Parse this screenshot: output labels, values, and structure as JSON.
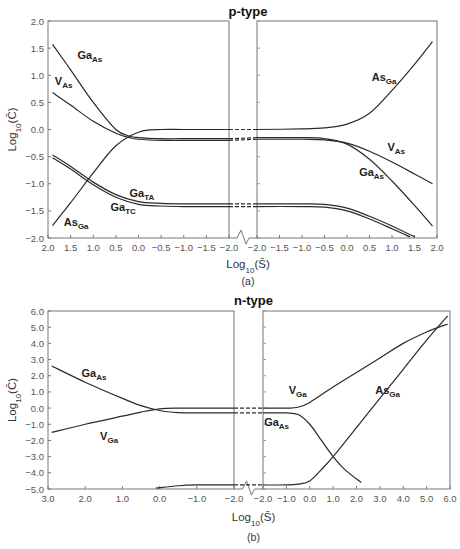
{
  "chart_data": [
    {
      "type": "line",
      "panel_label": "(a)",
      "title": "p-type",
      "xlabel": "Log10(S̄)",
      "ylabel": "Log10(C̄)",
      "ylim": [
        -2.0,
        2.0
      ],
      "yticks": [
        "2.0",
        "1.5",
        "1.0",
        "0.5",
        "0.0",
        "-0.5",
        "-1.0",
        "-1.5",
        "-2.0"
      ],
      "left_axis": {
        "xlim": [
          2.0,
          -2.0
        ],
        "xticks": [
          "2.0",
          "1.5",
          "1.0",
          "0.5",
          "0.0",
          "-0.5",
          "-1.0",
          "-1.5",
          "-2.0"
        ]
      },
      "right_axis": {
        "xlim": [
          -2.0,
          2.0
        ],
        "xticks": [
          "-2.0",
          "-1.5",
          "-1.0",
          "-0.5",
          "0.0",
          "0.5",
          "1.0",
          "1.5",
          "2.0"
        ]
      },
      "grid": false,
      "axis_break": true,
      "series": [
        {
          "name": "GaAs",
          "label": "Ga",
          "sub": "As",
          "side": "left",
          "x": [
            1.9,
            1.5,
            1.0,
            0.5,
            0.2,
            0.0,
            -0.5,
            -1.0,
            -2.0
          ],
          "y": [
            1.57,
            1.1,
            0.5,
            -0.0,
            -0.12,
            -0.15,
            -0.17,
            -0.17,
            -0.17
          ]
        },
        {
          "name": "VAs",
          "label": "V",
          "sub": "As",
          "side": "left",
          "x": [
            1.9,
            1.5,
            1.0,
            0.5,
            0.2,
            0.0,
            -0.5,
            -1.0,
            -2.0
          ],
          "y": [
            0.68,
            0.45,
            0.15,
            -0.07,
            -0.15,
            -0.18,
            -0.2,
            -0.2,
            -0.2
          ]
        },
        {
          "name": "AsGa",
          "label": "As",
          "sub": "Ga",
          "side": "left",
          "x": [
            1.9,
            1.5,
            1.0,
            0.5,
            0.0,
            -0.5,
            -1.0,
            -2.0
          ],
          "y": [
            -1.77,
            -1.35,
            -0.8,
            -0.3,
            -0.05,
            0.0,
            0.0,
            0.0
          ]
        },
        {
          "name": "GaTA",
          "label": "Ga",
          "sub": "TA",
          "side": "left",
          "x": [
            1.9,
            1.5,
            1.0,
            0.5,
            0.0,
            -0.5,
            -1.0,
            -2.0
          ],
          "y": [
            -0.47,
            -0.68,
            -0.97,
            -1.2,
            -1.33,
            -1.36,
            -1.37,
            -1.37
          ]
        },
        {
          "name": "GaTC",
          "label": "Ga",
          "sub": "TC",
          "side": "left",
          "x": [
            1.9,
            1.5,
            1.0,
            0.5,
            0.0,
            -0.5,
            -1.0,
            -2.0
          ],
          "y": [
            -0.52,
            -0.73,
            -1.02,
            -1.25,
            -1.38,
            -1.41,
            -1.42,
            -1.42
          ]
        },
        {
          "name": "AsGa",
          "label": "As",
          "sub": "Ga",
          "side": "right",
          "x": [
            -2.0,
            -1.0,
            -0.5,
            0.0,
            0.5,
            1.0,
            1.5,
            1.9
          ],
          "y": [
            0.0,
            0.01,
            0.03,
            0.1,
            0.3,
            0.72,
            1.2,
            1.62
          ]
        },
        {
          "name": "VAs",
          "label": "V",
          "sub": "As",
          "side": "right",
          "x": [
            -2.0,
            -1.0,
            -0.5,
            0.0,
            0.5,
            1.0,
            1.5,
            1.9
          ],
          "y": [
            -0.18,
            -0.18,
            -0.19,
            -0.25,
            -0.4,
            -0.6,
            -0.82,
            -1.0
          ]
        },
        {
          "name": "GaAs",
          "label": "Ga",
          "sub": "As",
          "side": "right",
          "x": [
            -2.0,
            -1.0,
            -0.5,
            0.0,
            0.5,
            1.0,
            1.5,
            1.9
          ],
          "y": [
            -0.15,
            -0.15,
            -0.17,
            -0.27,
            -0.55,
            -0.95,
            -1.4,
            -1.78
          ]
        },
        {
          "name": "GaTA",
          "label": "Ga",
          "sub": "TA",
          "side": "right",
          "x": [
            -2.0,
            -1.0,
            -0.5,
            0.0,
            0.5,
            1.0,
            1.5
          ],
          "y": [
            -1.37,
            -1.37,
            -1.38,
            -1.45,
            -1.6,
            -1.78,
            -1.98
          ]
        },
        {
          "name": "GaTC",
          "label": "Ga",
          "sub": "TC",
          "side": "right",
          "x": [
            -2.0,
            -1.0,
            -0.5,
            0.0,
            0.5,
            1.0,
            1.4
          ],
          "y": [
            -1.42,
            -1.42,
            -1.43,
            -1.5,
            -1.65,
            -1.83,
            -1.98
          ]
        }
      ],
      "annotations": [
        {
          "text": "Ga",
          "sub": "As",
          "x": 1.35,
          "y": 1.3,
          "side": "left"
        },
        {
          "text": "V",
          "sub": "As",
          "x": 1.85,
          "y": 0.82,
          "side": "left"
        },
        {
          "text": "As",
          "sub": "Ga",
          "x": 1.65,
          "y": -1.78,
          "side": "left"
        },
        {
          "text": "Ga",
          "sub": "TA",
          "x": 0.2,
          "y": -1.25,
          "side": "left"
        },
        {
          "text": "Ga",
          "sub": "TC",
          "x": 0.62,
          "y": -1.5,
          "side": "left"
        },
        {
          "text": "As",
          "sub": "Ga",
          "x": 0.55,
          "y": 0.9,
          "side": "right"
        },
        {
          "text": "V",
          "sub": "As",
          "x": 0.9,
          "y": -0.4,
          "side": "right"
        },
        {
          "text": "Ga",
          "sub": "As",
          "x": 0.27,
          "y": -0.85,
          "side": "right"
        }
      ]
    },
    {
      "type": "line",
      "panel_label": "(b)",
      "title": "n-type",
      "xlabel": "Log10(S̄)",
      "ylabel": "Log10(C̄)",
      "ylim": [
        -5.0,
        6.0
      ],
      "yticks": [
        "6.0",
        "5.0",
        "4.0",
        "3.0",
        "2.0",
        "1.0",
        "0.0",
        "-1.0",
        "-2.0",
        "-3.0",
        "-4.0",
        "-5.0"
      ],
      "left_axis": {
        "xlim": [
          3.0,
          -2.0
        ],
        "xticks": [
          "3.0",
          "2.0",
          "1.0",
          "0.0",
          "-1.0",
          "-2.0"
        ]
      },
      "right_axis": {
        "xlim": [
          -2.0,
          6.0
        ],
        "xticks": [
          "-2.0",
          "-1.0",
          "0.0",
          "1.0",
          "2.0",
          "3.0",
          "4.0",
          "5.0",
          "6.0"
        ]
      },
      "grid": false,
      "axis_break": true,
      "series": [
        {
          "name": "GaAs",
          "label": "Ga",
          "sub": "As",
          "side": "left",
          "x": [
            2.9,
            2.0,
            1.0,
            0.5,
            0.0,
            -0.5,
            -1.0,
            -2.0
          ],
          "y": [
            2.6,
            1.6,
            0.6,
            0.15,
            -0.15,
            -0.28,
            -0.3,
            -0.3
          ]
        },
        {
          "name": "VGa",
          "label": "V",
          "sub": "Ga",
          "side": "left",
          "x": [
            2.9,
            2.0,
            1.0,
            0.5,
            0.0,
            -0.5,
            -1.0,
            -2.0
          ],
          "y": [
            -1.5,
            -1.0,
            -0.5,
            -0.25,
            -0.05,
            0.0,
            0.0,
            0.0
          ]
        },
        {
          "name": "AsGa",
          "label": "As",
          "sub": "Ga",
          "side": "left",
          "x": [
            0.1,
            -0.5,
            -1.0,
            -2.0
          ],
          "y": [
            -4.95,
            -4.8,
            -4.75,
            -4.75
          ]
        },
        {
          "name": "VGa",
          "label": "V",
          "sub": "Ga",
          "side": "right",
          "x": [
            -2.0,
            -1.0,
            -0.5,
            0.0,
            1.0,
            2.0,
            3.0,
            4.0,
            5.0,
            5.9
          ],
          "y": [
            0.0,
            0.0,
            0.05,
            0.35,
            1.3,
            2.2,
            3.1,
            4.0,
            4.7,
            5.2
          ]
        },
        {
          "name": "GaAs",
          "label": "Ga",
          "sub": "As",
          "side": "right",
          "x": [
            -2.0,
            -1.0,
            -0.5,
            0.0,
            0.5,
            1.0,
            1.5,
            2.2
          ],
          "y": [
            -0.3,
            -0.3,
            -0.4,
            -1.0,
            -2.0,
            -3.0,
            -3.8,
            -4.6
          ]
        },
        {
          "name": "AsGa",
          "label": "As",
          "sub": "Ga",
          "side": "right",
          "x": [
            -2.0,
            -1.0,
            -0.5,
            0.0,
            0.5,
            1.0,
            2.0,
            3.0,
            4.0,
            5.0,
            5.9
          ],
          "y": [
            -4.75,
            -4.75,
            -4.7,
            -4.5,
            -3.8,
            -3.0,
            -1.2,
            0.6,
            2.4,
            4.2,
            5.7
          ]
        }
      ],
      "annotations": [
        {
          "text": "Ga",
          "sub": "As",
          "x": 2.1,
          "y": 1.9,
          "side": "left"
        },
        {
          "text": "V",
          "sub": "Ga",
          "x": 1.6,
          "y": -2.0,
          "side": "left"
        },
        {
          "text": "V",
          "sub": "Ga",
          "x": -0.9,
          "y": 0.9,
          "side": "right"
        },
        {
          "text": "Ga",
          "sub": "As",
          "x": -1.95,
          "y": -1.1,
          "side": "right"
        },
        {
          "text": "As",
          "sub": "Ga",
          "x": 2.8,
          "y": 0.9,
          "side": "right"
        }
      ]
    }
  ]
}
